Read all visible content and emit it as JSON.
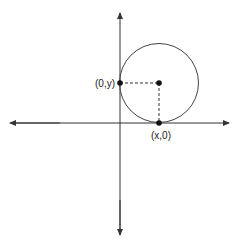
{
  "diagram": {
    "type": "coordinate-plane-circle",
    "labels": {
      "y_intercept": "(0,y)",
      "x_intercept": "(x,0)"
    },
    "colors": {
      "stroke": "#333333",
      "background": "#ffffff"
    }
  }
}
